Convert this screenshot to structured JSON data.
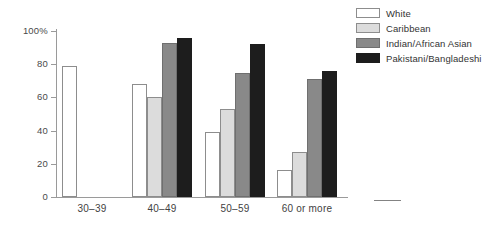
{
  "chart_data": {
    "type": "bar",
    "title": "",
    "xlabel": "",
    "ylabel": "",
    "ylim": [
      0,
      100
    ],
    "yticks": [
      "0",
      "20",
      "40",
      "60",
      "80",
      "100%"
    ],
    "ytick_values": [
      0,
      20,
      40,
      60,
      80,
      100
    ],
    "grid": false,
    "legend_position": "top-right",
    "categories": [
      "30–39",
      "40–49",
      "50–59",
      "60 or more"
    ],
    "series": [
      {
        "name": "White",
        "color": "#ffffff",
        "values": [
          79,
          68,
          39,
          16
        ]
      },
      {
        "name": "Caribbean",
        "color": "#dcdcdc",
        "values": [
          null,
          60,
          53,
          27
        ]
      },
      {
        "name": "Indian/African Asian",
        "color": "#898989",
        "values": [
          null,
          93,
          75,
          71
        ]
      },
      {
        "name": "Pakistani/Bangladeshi",
        "color": "#1d1d1d",
        "values": [
          null,
          96,
          92,
          76
        ]
      }
    ]
  },
  "legend": {
    "items": [
      {
        "label": "White"
      },
      {
        "label": "Caribbean"
      },
      {
        "label": "Indian/African Asian"
      },
      {
        "label": "Pakistani/Bangladeshi"
      }
    ]
  }
}
